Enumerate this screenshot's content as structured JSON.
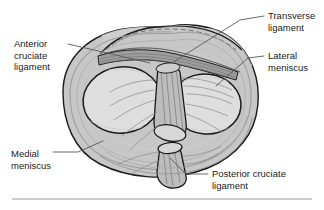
{
  "figure": {
    "view": "superior-view-right-knee",
    "colors": {
      "ink": "#1a1a1a",
      "leader_line": "#55585a",
      "rule": "#9a9a9a",
      "bone_surface": "#d6d6d6",
      "cartilage_light": "#e3e3e3",
      "meniscus_mid": "#c0c0c0",
      "meniscus_dark": "#a3a3a3",
      "ligament_fiber": "#8e8e8e",
      "stump_face": "#cfcfcf",
      "background": "#ffffff"
    }
  },
  "labels": [
    {
      "id": "anterior-cruciate-ligament",
      "lines": [
        "Anterior",
        "cruciate",
        "ligament"
      ],
      "line1": "Anterior",
      "line2": "cruciate",
      "line3": "ligament",
      "position": "upper-left"
    },
    {
      "id": "transverse-ligament",
      "lines": [
        "Transverse",
        "ligament"
      ],
      "line1": "Transverse",
      "line2": "ligament",
      "line3": "",
      "position": "upper-right"
    },
    {
      "id": "lateral-meniscus",
      "lines": [
        "Lateral",
        "meniscus"
      ],
      "line1": "Lateral",
      "line2": "meniscus",
      "line3": "",
      "position": "middle-right"
    },
    {
      "id": "medial-meniscus",
      "lines": [
        "Medial",
        "meniscus"
      ],
      "line1": "Medial",
      "line2": "meniscus",
      "line3": "",
      "position": "lower-left"
    },
    {
      "id": "posterior-cruciate-ligament",
      "lines": [
        "Posterior cruciate",
        "ligament"
      ],
      "line1": "Posterior cruciate",
      "line2": "ligament",
      "line3": "",
      "position": "lower-right"
    }
  ],
  "rule": {
    "present": true,
    "x_start": 12,
    "x_end": 312,
    "y": 199
  }
}
